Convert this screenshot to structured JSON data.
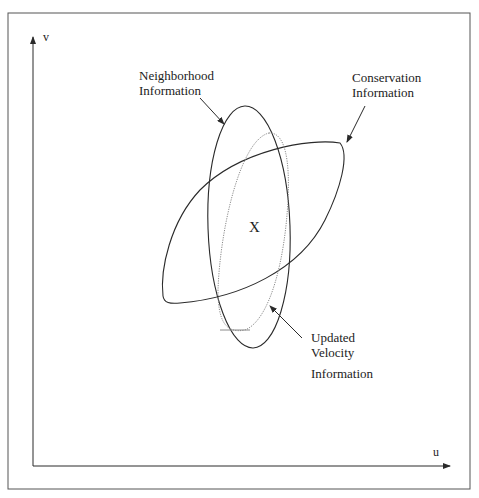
{
  "axes": {
    "x_label": "u",
    "y_label": "v"
  },
  "center_marker": "X",
  "labels": {
    "neighborhood": {
      "line1": "Neighborhood",
      "line2": "Information"
    },
    "conservation": {
      "line1": "Conservation",
      "line2": "Information"
    },
    "updated": {
      "line1": "Updated",
      "line2": "Velocity",
      "line3": "Information"
    }
  },
  "colors": {
    "stroke": "#2a2a2a",
    "dotted": "#8a8a8a",
    "frame": "#555555"
  }
}
